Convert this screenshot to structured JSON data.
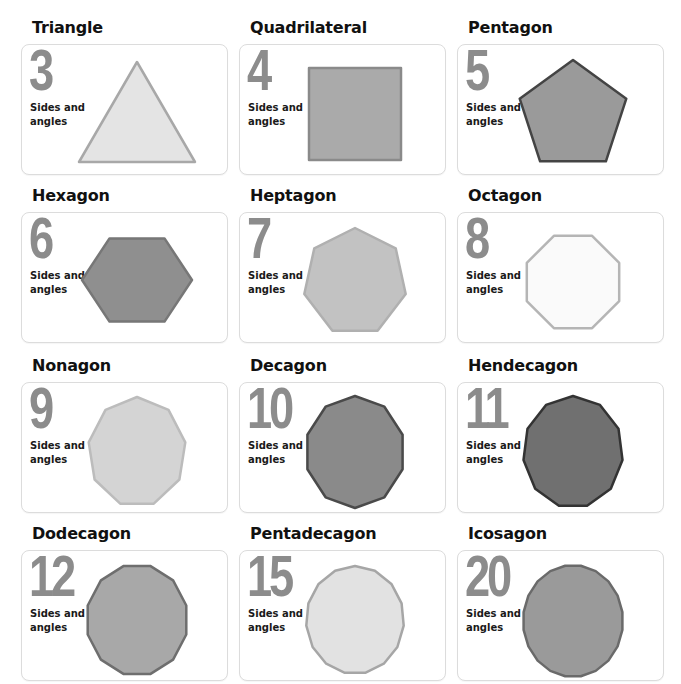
{
  "label_line1": "Sides and",
  "label_line2": "angles",
  "shapes": [
    {
      "name": "Triangle",
      "sides": "3",
      "n": 3,
      "fill": "#e4e4e4",
      "stroke": "#a8a8a8"
    },
    {
      "name": "Quadrilateral",
      "sides": "4",
      "n": 4,
      "fill": "#aaaaaa",
      "stroke": "#8a8a8a"
    },
    {
      "name": "Pentagon",
      "sides": "5",
      "n": 5,
      "fill": "#9a9a9a",
      "stroke": "#444444"
    },
    {
      "name": "Hexagon",
      "sides": "6",
      "n": 6,
      "fill": "#8f8f8f",
      "stroke": "#777777"
    },
    {
      "name": "Heptagon",
      "sides": "7",
      "n": 7,
      "fill": "#c2c2c2",
      "stroke": "#b0b0b0"
    },
    {
      "name": "Octagon",
      "sides": "8",
      "n": 8,
      "fill": "#fafafa",
      "stroke": "#b5b5b5"
    },
    {
      "name": "Nonagon",
      "sides": "9",
      "n": 9,
      "fill": "#d4d4d4",
      "stroke": "#bcbcbc"
    },
    {
      "name": "Decagon",
      "sides": "10",
      "n": 10,
      "fill": "#8a8a8a",
      "stroke": "#4a4a4a"
    },
    {
      "name": "Hendecagon",
      "sides": "11",
      "n": 11,
      "fill": "#707070",
      "stroke": "#333333"
    },
    {
      "name": "Dodecagon",
      "sides": "12",
      "n": 12,
      "fill": "#a8a8a8",
      "stroke": "#6e6e6e"
    },
    {
      "name": "Pentadecagon",
      "sides": "15",
      "n": 15,
      "fill": "#e2e2e2",
      "stroke": "#a6a6a6"
    },
    {
      "name": "Icosagon",
      "sides": "20",
      "n": 20,
      "fill": "#9a9a9a",
      "stroke": "#6a6a6a"
    }
  ]
}
